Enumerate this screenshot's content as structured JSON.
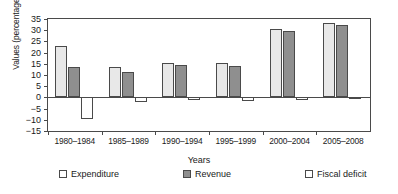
{
  "chart_data": {
    "type": "bar",
    "title": "",
    "xlabel": "Years",
    "ylabel": "Values (percentage of GDP)",
    "ylim": [
      -15,
      35
    ],
    "ytick_step": 5,
    "yticks": [
      35,
      30,
      25,
      20,
      15,
      10,
      5,
      0,
      -5,
      -10,
      -15
    ],
    "ytick_labels": [
      "35",
      "30",
      "25",
      "20",
      "15",
      "10",
      "5",
      "0",
      "−5",
      "−10",
      "−15"
    ],
    "grid": false,
    "legend_position": "bottom",
    "categories": [
      "1980–1984",
      "1985–1989",
      "1990–1994",
      "1995–1999",
      "2000–2004",
      "2005–2008"
    ],
    "series": [
      {
        "name": "Expenditure",
        "color": "#e8e8e8",
        "values": [
          23.0,
          13.5,
          15.5,
          15.5,
          30.5,
          33.0
        ]
      },
      {
        "name": "Revenue",
        "color": "#8f8f8f",
        "values": [
          13.5,
          11.5,
          14.5,
          14.0,
          29.5,
          32.5
        ]
      },
      {
        "name": "Fiscal deficit",
        "color": "#ffffff",
        "values": [
          -9.5,
          -2.0,
          -1.0,
          -1.5,
          -1.0,
          -0.5
        ]
      }
    ]
  },
  "legend": {
    "items": [
      {
        "label": "Expenditure",
        "swatch": "legend-swatch-expenditure"
      },
      {
        "label": "Revenue",
        "swatch": "legend-swatch-revenue"
      },
      {
        "label": "Fiscal deficit",
        "swatch": "legend-swatch-fiscal-deficit"
      }
    ]
  },
  "axis": {
    "x_title": "Years",
    "y_title": "Values (percentage of GDP)"
  }
}
